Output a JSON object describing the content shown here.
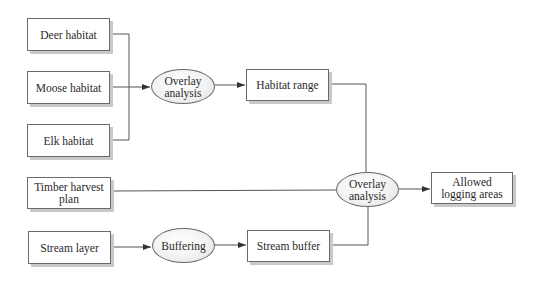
{
  "diagram": {
    "title": "",
    "nodes": {
      "deer": {
        "label": "Deer habitat",
        "shape": "rect"
      },
      "moose": {
        "label": "Moose habitat",
        "shape": "rect"
      },
      "elk": {
        "label": "Elk habitat",
        "shape": "rect"
      },
      "overlay1": {
        "label": "Overlay\nanalysis",
        "shape": "ellipse"
      },
      "habitat_range": {
        "label": "Habitat range",
        "shape": "rect"
      },
      "timber": {
        "label": "Timber harvest\nplan",
        "shape": "rect"
      },
      "stream_layer": {
        "label": "Stream layer",
        "shape": "rect"
      },
      "buffering": {
        "label": "Buffering",
        "shape": "ellipse"
      },
      "stream_buffer": {
        "label": "Stream buffer",
        "shape": "rect"
      },
      "overlay2": {
        "label": "Overlay\nanalysis",
        "shape": "ellipse"
      },
      "allowed": {
        "label": "Allowed\nlogging areas",
        "shape": "rect"
      }
    },
    "edges": [
      {
        "from": "deer",
        "to": "overlay1"
      },
      {
        "from": "moose",
        "to": "overlay1"
      },
      {
        "from": "elk",
        "to": "overlay1"
      },
      {
        "from": "overlay1",
        "to": "habitat_range"
      },
      {
        "from": "habitat_range",
        "to": "overlay2"
      },
      {
        "from": "timber",
        "to": "overlay2"
      },
      {
        "from": "stream_layer",
        "to": "buffering"
      },
      {
        "from": "buffering",
        "to": "stream_buffer"
      },
      {
        "from": "stream_buffer",
        "to": "overlay2"
      },
      {
        "from": "overlay2",
        "to": "allowed"
      }
    ],
    "colors": {
      "line": "#555555",
      "border": "#6a6a6a",
      "shadow": "#c9c9c9",
      "ellipse_fill": "#eeeeee"
    }
  }
}
